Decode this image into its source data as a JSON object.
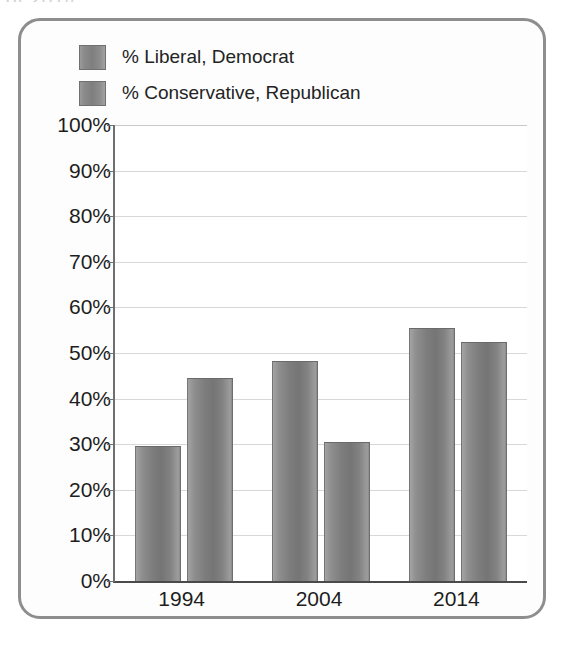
{
  "clipped_caption": "of 2014",
  "legend": {
    "position": "top-left",
    "items": [
      {
        "label": "% Liberal, Democrat",
        "swatch": "legend-swatch-liberal",
        "color": "#7f7f7f"
      },
      {
        "label": "% Conservative, Republican",
        "swatch": "legend-swatch-conservative",
        "color": "#7f7f7f"
      }
    ]
  },
  "chart_data": {
    "type": "bar",
    "title": "",
    "subtitle": "",
    "xlabel": "",
    "ylabel": "",
    "categories": [
      "1994",
      "2004",
      "2014"
    ],
    "series": [
      {
        "name": "% Liberal, Democrat",
        "values": [
          29.7,
          48.3,
          55.5
        ],
        "color": "#7f7f7f"
      },
      {
        "name": "% Conservative, Republican",
        "values": [
          44.5,
          30.5,
          52.4
        ],
        "color": "#7f7f7f"
      }
    ],
    "ylim": [
      0,
      100
    ],
    "ytick_values": [
      0,
      10,
      20,
      30,
      40,
      50,
      60,
      70,
      80,
      90,
      100
    ],
    "ytick_labels": [
      "0%",
      "10%",
      "20%",
      "30%",
      "40%",
      "50%",
      "60%",
      "70%",
      "80%",
      "90%",
      "100%"
    ],
    "grid": true,
    "grid_axis": "y",
    "legend_position": "top-left",
    "bar_orientation": "vertical",
    "value_format": "percent"
  }
}
